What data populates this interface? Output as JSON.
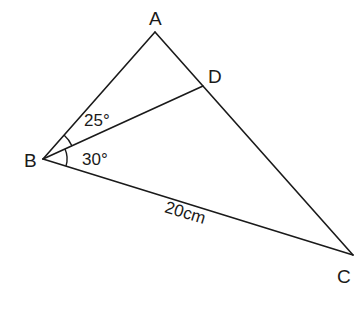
{
  "diagram": {
    "type": "triangle-geometry",
    "vertices": {
      "A": {
        "label": "A",
        "x": 155,
        "y": 32
      },
      "B": {
        "label": "B",
        "x": 43,
        "y": 159
      },
      "C": {
        "label": "C",
        "x": 353,
        "y": 255
      },
      "D": {
        "label": "D",
        "x": 203,
        "y": 86
      }
    },
    "segments": [
      {
        "from": "A",
        "to": "B"
      },
      {
        "from": "A",
        "to": "C"
      },
      {
        "from": "B",
        "to": "C"
      },
      {
        "from": "B",
        "to": "D"
      }
    ],
    "angles": {
      "ABD": {
        "label": "25°",
        "value": 25
      },
      "DBC": {
        "label": "30°",
        "value": 30
      }
    },
    "lengths": {
      "BC": {
        "label": "20cm",
        "value": 20,
        "unit": "cm"
      }
    },
    "colors": {
      "stroke": "#1a1a1a",
      "background": "#ffffff"
    }
  }
}
